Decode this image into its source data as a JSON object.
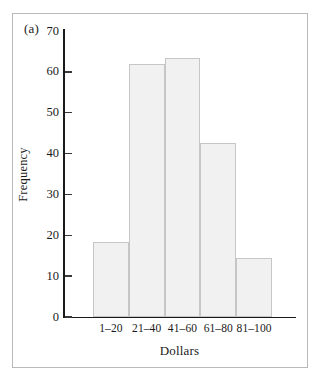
{
  "figure": {
    "panel_label": "(a)",
    "background_color": "#ffffff",
    "border_color": "#b9b9b9"
  },
  "chart_data": {
    "type": "bar",
    "title": "",
    "subtitle": "",
    "panel": "(a)",
    "categories": [
      "1–20",
      "21–40",
      "41–60",
      "61–80",
      "81–100"
    ],
    "values": [
      18.3,
      62,
      63.5,
      42.5,
      14.5
    ],
    "xlabel": "Dollars",
    "ylabel": "Frequency",
    "ylim": [
      0,
      70
    ],
    "ytick_values": [
      0,
      10,
      20,
      30,
      40,
      50,
      60,
      70
    ],
    "ytick_labels": [
      "0",
      "10",
      "20",
      "30",
      "40",
      "50",
      "60",
      "70"
    ],
    "grid": false,
    "legend": null,
    "bar_fill_color": "#f1f1f1",
    "bar_edge_color": "#c6c6c6",
    "axis_color": "#1a1a1a"
  }
}
